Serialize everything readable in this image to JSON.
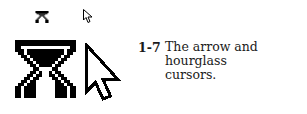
{
  "figure": {
    "number": "1-7",
    "caption_line1": "The arrow and hourglass",
    "caption_line2": "cursors.",
    "icons": [
      "hourglass-cursor-small",
      "arrow-cursor-small",
      "hourglass-cursor-large",
      "arrow-cursor-large"
    ]
  }
}
